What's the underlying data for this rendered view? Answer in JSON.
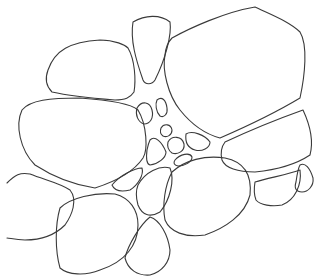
{
  "drawing": {
    "subject": "line drawing of irregular rounded stone or cell shapes",
    "stroke_color": "#3a3a3a",
    "background_color": "#ffffff",
    "shape_count": 24
  }
}
